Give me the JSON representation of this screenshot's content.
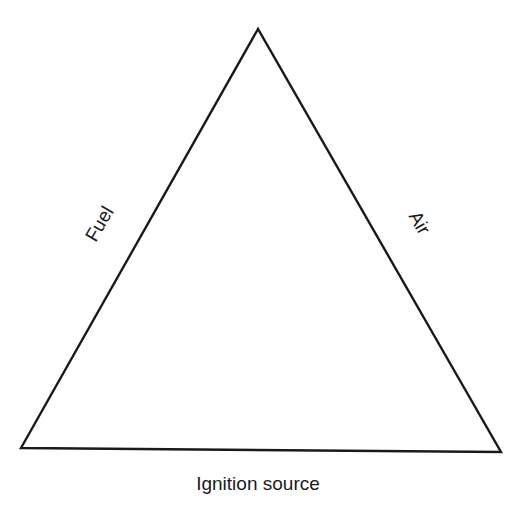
{
  "diagram": {
    "type": "fire-triangle",
    "sides": {
      "left": "Fuel",
      "right": "Air",
      "bottom": "Ignition source"
    },
    "colors": {
      "line": "#1a1a1a",
      "background": "#ffffff"
    }
  }
}
